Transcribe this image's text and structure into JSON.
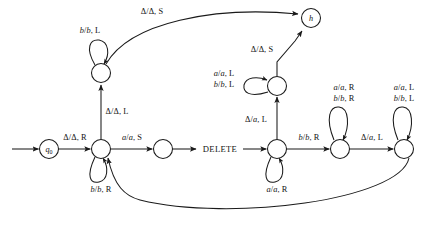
{
  "diagram": {
    "kind": "turing-machine-state-diagram",
    "stroke_color": "#1a1a1a",
    "background": "#ffffff",
    "nodes": [
      {
        "id": "q0",
        "name": "state-q0",
        "label": "q",
        "sub": "0",
        "cx": 49,
        "cy": 149,
        "r": 9.5
      },
      {
        "id": "s1",
        "name": "state-main-left",
        "label": "",
        "sub": "",
        "cx": 101,
        "cy": 149,
        "r": 9.5
      },
      {
        "id": "s2",
        "name": "state-upper-left",
        "label": "",
        "sub": "",
        "cx": 101,
        "cy": 73,
        "r": 9.5
      },
      {
        "id": "s3",
        "name": "state-after-a",
        "label": "",
        "sub": "",
        "cx": 163,
        "cy": 149,
        "r": 9.5
      },
      {
        "id": "s4",
        "name": "state-delete-entry",
        "label": "",
        "sub": "",
        "cx": 277,
        "cy": 149,
        "r": 9.5
      },
      {
        "id": "s5",
        "name": "state-upper-mid",
        "label": "",
        "sub": "",
        "cx": 277,
        "cy": 86,
        "r": 9.5
      },
      {
        "id": "s6",
        "name": "state-shift-right",
        "label": "",
        "sub": "",
        "cx": 340,
        "cy": 149,
        "r": 9.5
      },
      {
        "id": "s7",
        "name": "state-shift-left",
        "label": "",
        "sub": "",
        "cx": 404,
        "cy": 149,
        "r": 9.5
      },
      {
        "id": "h",
        "name": "state-halt",
        "label": "h",
        "sub": "",
        "cx": 311,
        "cy": 18,
        "r": 9.5
      }
    ],
    "edge_labels": [
      {
        "name": "edge-label-start-to-q0",
        "text_html": "",
        "x": 0,
        "y": 0,
        "hidden": true
      },
      {
        "name": "edge-label-q0-to-main",
        "text_html": "Δ/Δ, R",
        "x": 75,
        "y": 138
      },
      {
        "name": "edge-label-main-to-after-a",
        "text_html": "<i>a</i>/<i>a</i>, S",
        "x": 132,
        "y": 138
      },
      {
        "name": "edge-label-main-self-loop",
        "text_html": "<i>b</i>/<i>b</i>, R",
        "x": 101,
        "y": 190
      },
      {
        "name": "edge-label-main-to-upper",
        "text_html": "Δ/Δ, L",
        "x": 116,
        "y": 112
      },
      {
        "name": "edge-label-upper-self-loop",
        "text_html": "<i>b</i>/<i>b</i>, L",
        "x": 90,
        "y": 31
      },
      {
        "name": "edge-label-upper-to-halt",
        "text_html": "Δ/Δ, S",
        "x": 151,
        "y": 12
      },
      {
        "name": "edge-label-delete-entry-top",
        "text_html": "Δ/<i>a</i>, L",
        "x": 256,
        "y": 120
      },
      {
        "name": "edge-label-upper-mid-to-halt",
        "text_html": "Δ/Δ, S",
        "x": 261,
        "y": 50
      },
      {
        "name": "edge-label-upper-mid-loop-1",
        "text_html": "<i>a</i>/<i>a</i>, L",
        "x": 224,
        "y": 74
      },
      {
        "name": "edge-label-upper-mid-loop-2",
        "text_html": "<i>b</i>/<i>b</i>, L",
        "x": 224,
        "y": 85
      },
      {
        "name": "edge-label-delete-self-loop",
        "text_html": "<i>a</i>/<i>a</i>, R",
        "x": 277,
        "y": 190
      },
      {
        "name": "edge-label-delete-to-shift-r",
        "text_html": "<i>b</i>/<i>b</i>, R",
        "x": 309,
        "y": 138
      },
      {
        "name": "edge-label-shift-r-loop-1",
        "text_html": "<i>a</i>/<i>a</i>, R",
        "x": 344,
        "y": 88
      },
      {
        "name": "edge-label-shift-r-loop-2",
        "text_html": "<i>b</i>/<i>b</i>, R",
        "x": 344,
        "y": 99
      },
      {
        "name": "edge-label-shift-r-to-shift-l",
        "text_html": "Δ/<i>a</i>, L",
        "x": 372,
        "y": 138
      },
      {
        "name": "edge-label-shift-l-loop-1",
        "text_html": "<i>a</i>/<i>a</i>, L",
        "x": 404,
        "y": 88
      },
      {
        "name": "edge-label-shift-l-loop-2",
        "text_html": "<i>b</i>/<i>b</i>, L",
        "x": 404,
        "y": 99
      }
    ],
    "word_labels": [
      {
        "name": "subroutine-label-delete",
        "text": "DELETE",
        "x": 220,
        "y": 149
      }
    ]
  }
}
